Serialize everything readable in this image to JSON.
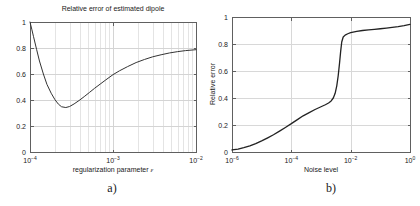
{
  "figure": {
    "background": "#ffffff",
    "text_color": "#1a1a1a"
  },
  "chart_data": [
    {
      "type": "line",
      "caption": "a)",
      "title": "Relative error of estimated dipole",
      "xlabel": "regularization parameter ε",
      "ylabel": "",
      "xscale": "log",
      "xlim": [
        0.0001,
        0.01
      ],
      "ylim": [
        0,
        1
      ],
      "xticks": [
        0.0001,
        0.001,
        0.01
      ],
      "xtick_exponents": [
        -4,
        -3,
        -2
      ],
      "yticks": [
        0,
        0.2,
        0.4,
        0.6,
        0.8,
        1
      ],
      "ytick_labels": [
        "0",
        "0.2",
        "0.4",
        "0.6",
        "0.8",
        "1"
      ],
      "grid": true,
      "minor_grid": true,
      "legend": "none",
      "line_color": "#333333",
      "line_width": 1.0,
      "grid_color": "#d4d4d4",
      "minor_grid_color": "#e4e4e4",
      "frame_color": "#606060",
      "text_color": "#1a1a1a",
      "x": [
        0.0001,
        0.000105,
        0.00011,
        0.00012,
        0.00013,
        0.000145,
        0.00016,
        0.00018,
        0.0002,
        0.00022,
        0.00024,
        0.00027,
        0.0003,
        0.00034,
        0.00039,
        0.00045,
        0.00052,
        0.0006,
        0.0007,
        0.00082,
        0.001,
        0.0012,
        0.0015,
        0.0019,
        0.0024,
        0.003,
        0.0038,
        0.0048,
        0.006,
        0.0075,
        0.01
      ],
      "y": [
        1.0,
        0.945,
        0.89,
        0.79,
        0.7,
        0.6,
        0.52,
        0.452,
        0.402,
        0.368,
        0.348,
        0.342,
        0.35,
        0.37,
        0.396,
        0.426,
        0.458,
        0.49,
        0.522,
        0.555,
        0.595,
        0.625,
        0.657,
        0.688,
        0.712,
        0.732,
        0.748,
        0.762,
        0.772,
        0.78,
        0.787
      ]
    },
    {
      "type": "line",
      "caption": "b)",
      "title": "",
      "xlabel": "Noise level",
      "ylabel": "Relative error",
      "xscale": "log",
      "xlim": [
        1e-06,
        1
      ],
      "ylim": [
        0,
        1
      ],
      "xticks": [
        1e-06,
        0.0001,
        0.01,
        1
      ],
      "xtick_exponents": [
        -6,
        -4,
        -2,
        0
      ],
      "yticks": [
        0,
        0.2,
        0.4,
        0.6,
        0.8,
        1
      ],
      "ytick_labels": [
        "0",
        "0.2",
        "0.4",
        "0.6",
        "0.8",
        "1"
      ],
      "grid": true,
      "minor_grid": false,
      "legend": "none",
      "line_color": "#222222",
      "line_width": 1.3,
      "grid_color": "#d8d8d8",
      "minor_grid_color": "#e4e4e4",
      "frame_color": "#606060",
      "text_color": "#1a1a1a",
      "x": [
        1e-06,
        1.6e-06,
        2.5e-06,
        4e-06,
        6.3e-06,
        1e-05,
        1.6e-05,
        2.5e-05,
        4e-05,
        6.3e-05,
        0.0001,
        0.00016,
        0.00025,
        0.0004,
        0.00063,
        0.001,
        0.0014,
        0.0018,
        0.0022,
        0.0026,
        0.003,
        0.0034,
        0.0038,
        0.0042,
        0.0046,
        0.005,
        0.0056,
        0.0065,
        0.008,
        0.01,
        0.016,
        0.025,
        0.04,
        0.063,
        0.1,
        0.16,
        0.25,
        0.4,
        0.63,
        1.0
      ],
      "y": [
        0.015,
        0.022,
        0.032,
        0.045,
        0.062,
        0.082,
        0.105,
        0.128,
        0.155,
        0.182,
        0.21,
        0.24,
        0.268,
        0.292,
        0.315,
        0.335,
        0.35,
        0.363,
        0.378,
        0.4,
        0.435,
        0.49,
        0.565,
        0.655,
        0.745,
        0.815,
        0.852,
        0.866,
        0.876,
        0.884,
        0.894,
        0.9,
        0.905,
        0.909,
        0.913,
        0.918,
        0.923,
        0.929,
        0.936,
        0.945
      ]
    }
  ]
}
